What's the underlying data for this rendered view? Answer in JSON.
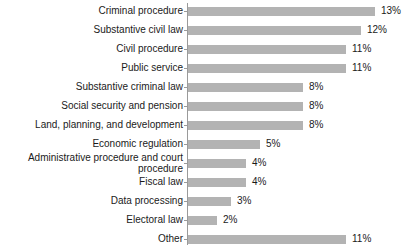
{
  "chart_data": {
    "type": "bar",
    "orientation": "horizontal",
    "title": "",
    "subtitle": "",
    "xlabel": "",
    "ylabel": "",
    "grid": false,
    "legend": null,
    "xlim": [
      0,
      13
    ],
    "value_format": "percent",
    "bar_color": "#b3b3b3",
    "axis_color": "#9a9a9a",
    "background_color": "#ffffff",
    "text_color": "#1a1a1a",
    "categories": [
      "Criminal procedure",
      "Substantive civil law",
      "Civil procedure",
      "Public service",
      "Substantive criminal law",
      "Social security and pension",
      "Land, planning, and development",
      "Economic regulation",
      "Administrative procedure and court procedure",
      "Fiscal law",
      "Data processing",
      "Electoral law",
      "Other"
    ],
    "values": [
      13,
      12,
      11,
      11,
      8,
      8,
      8,
      5,
      4,
      4,
      3,
      2,
      11
    ],
    "value_labels": [
      "13%",
      "12%",
      "11%",
      "11%",
      "8%",
      "8%",
      "8%",
      "5%",
      "4%",
      "4%",
      "3%",
      "2%",
      "11%"
    ],
    "rows": [
      {
        "label": "Criminal procedure",
        "value": 13,
        "value_label": "13%",
        "two_line": false
      },
      {
        "label": "Substantive civil law",
        "value": 12,
        "value_label": "12%",
        "two_line": false
      },
      {
        "label": "Civil procedure",
        "value": 11,
        "value_label": "11%",
        "two_line": false
      },
      {
        "label": "Public service",
        "value": 11,
        "value_label": "11%",
        "two_line": false
      },
      {
        "label": "Substantive criminal law",
        "value": 8,
        "value_label": "8%",
        "two_line": false
      },
      {
        "label": "Social security and pension",
        "value": 8,
        "value_label": "8%",
        "two_line": false
      },
      {
        "label": "Land, planning, and development",
        "value": 8,
        "value_label": "8%",
        "two_line": false
      },
      {
        "label": "Economic regulation",
        "value": 5,
        "value_label": "5%",
        "two_line": false
      },
      {
        "label": "Administrative procedure and court\nprocedure",
        "value": 4,
        "value_label": "4%",
        "two_line": true
      },
      {
        "label": "Fiscal law",
        "value": 4,
        "value_label": "4%",
        "two_line": false
      },
      {
        "label": "Data processing",
        "value": 3,
        "value_label": "3%",
        "two_line": false
      },
      {
        "label": "Electoral law",
        "value": 2,
        "value_label": "2%",
        "two_line": false
      },
      {
        "label": "Other",
        "value": 11,
        "value_label": "11%",
        "two_line": false
      }
    ]
  },
  "layout": {
    "row_pitch": 19,
    "first_row_top": 2,
    "bar_origin_x": 188,
    "px_per_unit": 14.4,
    "value_label_gap": 6
  }
}
